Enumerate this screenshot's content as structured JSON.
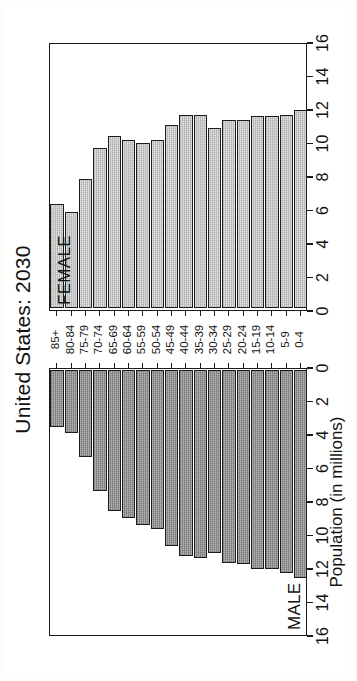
{
  "figure": {
    "title": "United States: 2030",
    "xaxis_title": "Population (in millions)",
    "panel_labels": {
      "male": "MALE",
      "female": "FEMALE"
    },
    "orientation_note": "rotated"
  },
  "chart_data": {
    "type": "bar",
    "title": "United States: 2030",
    "subtitle": "",
    "xlabel": "Population (in millions)",
    "ylabel": "",
    "xlim": [
      0,
      16
    ],
    "ylim": [
      0,
      18
    ],
    "grid": false,
    "legend_position": "panel-labels",
    "axis_ticks": [
      0,
      2,
      4,
      6,
      8,
      10,
      12,
      14,
      16
    ],
    "categories": [
      "85+",
      "80-84",
      "75-79",
      "70-74",
      "65-69",
      "60-64",
      "55-59",
      "50-54",
      "45-49",
      "40-44",
      "35-39",
      "30-34",
      "25-29",
      "20-24",
      "15-19",
      "10-14",
      "5-9",
      "0-4"
    ],
    "series": [
      {
        "name": "MALE",
        "color": "#8d8d8d",
        "values": [
          3.4,
          3.8,
          5.2,
          7.3,
          8.5,
          8.9,
          9.3,
          9.6,
          10.6,
          11.2,
          11.3,
          11.0,
          11.6,
          11.7,
          12.0,
          12.0,
          12.2,
          12.5
        ]
      },
      {
        "name": "FEMALE",
        "color": "#c2c2c2",
        "values": [
          6.3,
          5.8,
          7.8,
          9.7,
          10.4,
          10.2,
          10.0,
          10.2,
          11.1,
          11.7,
          11.7,
          10.9,
          11.4,
          11.4,
          11.6,
          11.6,
          11.7,
          12.0
        ]
      }
    ]
  }
}
